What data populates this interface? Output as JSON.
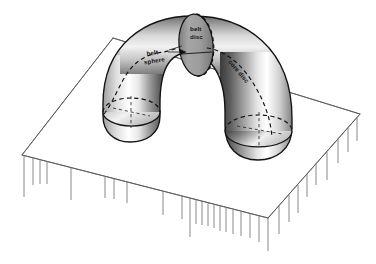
{
  "figure": {
    "background_color": "#ffffff",
    "ink_color": "#111111",
    "plate_line_color": "#5a5a5a",
    "shading": {
      "dark_gray": "#3c3c3c",
      "mid_gray": "#8f8f8f",
      "light_gray": "#d8d8d8",
      "highlight": "#ffffff",
      "disc_fill": "#9a9a9a"
    },
    "labels": [
      {
        "id": "belt-sphere",
        "text_line_1": "belt",
        "text_line_2": "sphere",
        "full_text": "belt sphere",
        "rotation_deg": -9,
        "x": 147,
        "y": 56
      },
      {
        "id": "belt-disc",
        "text_line_1": "belt",
        "text_line_2": "disc",
        "full_text": "belt disc",
        "rotation_deg": 0,
        "x": 190,
        "y": 31
      },
      {
        "id": "core-disc",
        "text_line_1": "core disc",
        "text_line_2": "",
        "full_text": "core disc",
        "rotation_deg": 50,
        "x": 228,
        "y": 62
      }
    ],
    "plate": {
      "corner_back": [
        113,
        38
      ],
      "corner_left": [
        22,
        155
      ],
      "corner_front": [
        268,
        218
      ],
      "corner_right": [
        360,
        114
      ],
      "hatch_count_left_edge": 9,
      "hatch_count_right_edge": 20
    },
    "handle": {
      "shape": "solid torus arch",
      "left_foot_center": [
        131,
        100
      ],
      "right_foot_center": [
        262,
        126
      ],
      "apex": [
        196,
        20
      ]
    }
  }
}
